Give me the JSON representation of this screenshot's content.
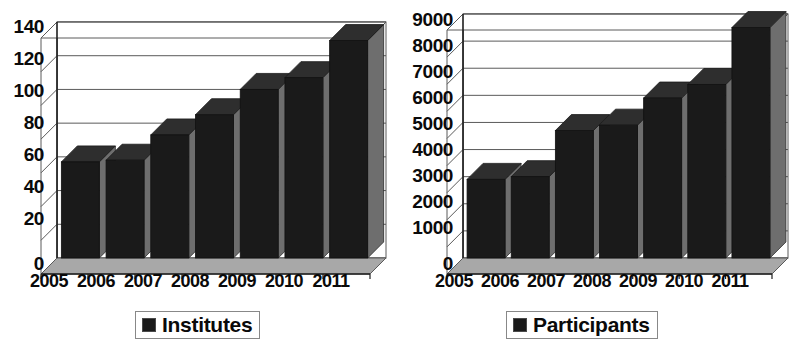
{
  "figure": {
    "title": "",
    "panel_count": 2
  },
  "chart_data": [
    {
      "type": "bar",
      "title": "Institutes",
      "xlabel": "",
      "ylabel": "",
      "categories": [
        "2005",
        "2006",
        "2007",
        "2008",
        "2009",
        "2010",
        "2011"
      ],
      "values": [
        57,
        58,
        73,
        85,
        100,
        107,
        129
      ],
      "series": [
        {
          "name": "Institutes",
          "values": [
            57,
            58,
            73,
            85,
            100,
            107,
            129
          ]
        }
      ],
      "ylim": [
        0,
        140
      ],
      "ytick_step": 20,
      "yticks": [
        0,
        20,
        40,
        60,
        80,
        100,
        120,
        140
      ],
      "ytick_labels": [
        "0",
        "20",
        "40",
        "60",
        "80",
        "100",
        "120",
        "140"
      ],
      "grid": true,
      "grid_axis": "y",
      "legend": {
        "position": "bottom",
        "entries": [
          "Institutes"
        ]
      },
      "style": "3d-column",
      "bar_color": "#1a1a1a",
      "floor_color": "#a8a8a8",
      "side_shadow_color": "#6e6e6e",
      "axis_color": "#5a5a5a"
    },
    {
      "type": "bar",
      "title": "Participants",
      "xlabel": "",
      "ylabel": "",
      "categories": [
        "2005",
        "2006",
        "2007",
        "2008",
        "2009",
        "2010",
        "2011"
      ],
      "values": [
        2900,
        3000,
        4700,
        4900,
        5900,
        6400,
        8500
      ],
      "series": [
        {
          "name": "Participants",
          "values": [
            2900,
            3000,
            4700,
            4900,
            5900,
            6400,
            8500
          ]
        }
      ],
      "ylim": [
        0,
        9000
      ],
      "ytick_step": 1000,
      "yticks": [
        0,
        1000,
        2000,
        3000,
        4000,
        5000,
        6000,
        7000,
        8000,
        9000
      ],
      "ytick_labels": [
        "0",
        "1000",
        "2000",
        "3000",
        "4000",
        "5000",
        "6000",
        "7000",
        "8000",
        "9000"
      ],
      "grid": true,
      "grid_axis": "y",
      "legend": {
        "position": "bottom",
        "entries": [
          "Participants"
        ]
      },
      "style": "3d-column",
      "bar_color": "#1a1a1a",
      "floor_color": "#a8a8a8",
      "side_shadow_color": "#6e6e6e",
      "axis_color": "#5a5a5a"
    }
  ],
  "left_panel": {
    "yticks": [
      "140",
      "120",
      "100",
      "80",
      "60",
      "40",
      "20",
      "0"
    ],
    "xticks": [
      "2005",
      "2006",
      "2007",
      "2008",
      "2009",
      "2010",
      "2011"
    ],
    "legend_label": "Institutes"
  },
  "right_panel": {
    "yticks": [
      "9000",
      "8000",
      "7000",
      "6000",
      "5000",
      "4000",
      "3000",
      "2000",
      "1000",
      "0"
    ],
    "xticks": [
      "2005",
      "2006",
      "2007",
      "2008",
      "2009",
      "2010",
      "2011"
    ],
    "legend_label": "Participants"
  }
}
